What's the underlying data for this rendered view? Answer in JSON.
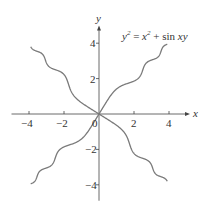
{
  "chart_data": {
    "type": "line",
    "equation": {
      "lhs_var": "y",
      "lhs_exp": "2",
      "eq": " = ",
      "rhs_var": "x",
      "rhs_exp": "2",
      "plus": " + ",
      "func": "sin",
      "arg": "xy"
    },
    "xlabel": "x",
    "ylabel": "y",
    "xlim": [
      -5,
      5.2
    ],
    "ylim": [
      -4.9,
      5
    ],
    "grid": false,
    "legend": "none",
    "x_ticks": [
      -4,
      -2,
      2,
      4
    ],
    "x_tick_labels": [
      "−4",
      "−2",
      "2",
      "4"
    ],
    "y_ticks": [
      -4,
      -2,
      2,
      4
    ],
    "y_tick_labels": [
      "−4",
      "−2",
      "2",
      "4"
    ],
    "origin_label": "0",
    "curve_color": "#7a7a7a",
    "axis_color": "#444444",
    "series": [
      {
        "name": "upper-right branch",
        "x": [
          0,
          0.5,
          1,
          1.5,
          2,
          2.5,
          3,
          3.5,
          3.9
        ],
        "y": [
          0,
          0.8,
          1.41,
          1.68,
          1.86,
          2.49,
          3.05,
          3.42,
          3.95
        ]
      },
      {
        "name": "lower-right branch",
        "x": [
          0,
          0.5,
          1,
          1.5,
          2,
          2.5,
          3,
          3.5,
          3.9
        ],
        "y": [
          0,
          -0.29,
          -0.64,
          -1.27,
          -2.16,
          -2.51,
          -2.94,
          -3.57,
          -3.85
        ]
      },
      {
        "name": "upper-left branch",
        "x": [
          0,
          -0.5,
          -1,
          -1.5,
          -2,
          -2.5,
          -3,
          -3.5,
          -3.9
        ],
        "y": [
          0,
          0.29,
          0.64,
          1.27,
          2.16,
          2.51,
          2.94,
          3.57,
          3.85
        ]
      },
      {
        "name": "lower-left branch",
        "x": [
          0,
          -0.5,
          -1,
          -1.5,
          -2,
          -2.5,
          -3,
          -3.5,
          -3.9
        ],
        "y": [
          0,
          -0.8,
          -1.41,
          -1.68,
          -1.86,
          -2.49,
          -3.05,
          -3.42,
          -3.95
        ]
      }
    ]
  },
  "axes": {
    "x_label": "x",
    "y_label": "y",
    "origin": "0"
  }
}
